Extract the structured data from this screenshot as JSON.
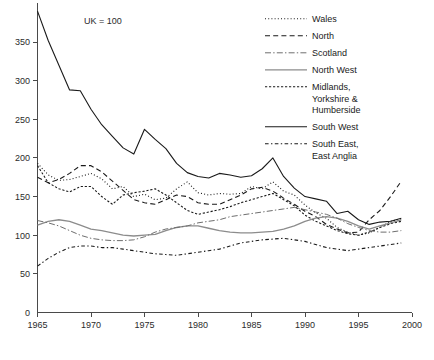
{
  "title_partial": "",
  "annotation": {
    "uk_base": "UK = 100"
  },
  "axes": {
    "y_ticks": [
      "50",
      "100",
      "150",
      "200",
      "250",
      "300",
      "350"
    ],
    "y_zero": "0",
    "x_ticks": [
      "1965",
      "1970",
      "1975",
      "1980",
      "1985",
      "1990",
      "1995",
      "2000"
    ]
  },
  "legend": {
    "items": [
      {
        "label": "Wales",
        "style": "dotted",
        "color": "#1a1a1a"
      },
      {
        "label": "North",
        "style": "dashed",
        "color": "#1a1a1a"
      },
      {
        "label": "Scotland",
        "style": "dash-dot",
        "color": "#6e6e6e"
      },
      {
        "label": "North West",
        "style": "solid",
        "color": "#8c8c8c"
      },
      {
        "label": "Midlands, Yorkshire & Humberside",
        "style": "dotted-dense",
        "color": "#1a1a1a"
      },
      {
        "label": "South West",
        "style": "long-dash-dot",
        "color": "#1a1a1a"
      },
      {
        "label": "South East, East Anglia",
        "style": "dash-dash",
        "color": "#1a1a1a"
      }
    ],
    "wrapped_labels": {
      "midlands": [
        "Midlands,",
        "Yorkshire &",
        "Humberside"
      ],
      "southeast": [
        "South East,",
        "East Anglia"
      ]
    }
  },
  "chart_data": {
    "type": "line",
    "title": "",
    "subtitle": "",
    "xlabel": "",
    "ylabel": "",
    "xlim": [
      1965,
      2000
    ],
    "ylim": [
      0,
      390
    ],
    "grid": false,
    "legend_position": "top-right",
    "annotations": [
      "UK = 100"
    ],
    "x": [
      1965,
      1966,
      1967,
      1968,
      1969,
      1970,
      1971,
      1972,
      1973,
      1974,
      1975,
      1976,
      1977,
      1978,
      1979,
      1980,
      1981,
      1982,
      1983,
      1984,
      1985,
      1986,
      1987,
      1988,
      1989,
      1990,
      1991,
      1992,
      1993,
      1994,
      1995,
      1996,
      1997,
      1998,
      1999
    ],
    "series": [
      {
        "name": "South West",
        "style": "long-dash-dot",
        "values": [
          390,
          352,
          320,
          288,
          287,
          263,
          243,
          228,
          213,
          205,
          237,
          224,
          212,
          193,
          181,
          176,
          174,
          180,
          178,
          175,
          177,
          186,
          200,
          176,
          161,
          150,
          147,
          144,
          128,
          131,
          120,
          114,
          117,
          118,
          122
        ]
      },
      {
        "name": "Wales",
        "style": "dotted",
        "values": [
          193,
          178,
          171,
          172,
          176,
          180,
          173,
          160,
          163,
          150,
          153,
          146,
          148,
          160,
          169,
          155,
          152,
          154,
          153,
          154,
          163,
          160,
          169,
          157,
          152,
          139,
          129,
          122,
          110,
          104,
          100,
          103,
          110,
          118,
          121
        ]
      },
      {
        "name": "North",
        "style": "dashed",
        "values": [
          175,
          168,
          172,
          180,
          190,
          190,
          182,
          170,
          158,
          146,
          142,
          140,
          146,
          152,
          150,
          142,
          140,
          140,
          146,
          152,
          160,
          162,
          157,
          148,
          140,
          131,
          124,
          114,
          108,
          103,
          104,
          120,
          132,
          150,
          170
        ]
      },
      {
        "name": "Midlands, Yorkshire & Humberside",
        "style": "dotted-dense",
        "values": [
          190,
          168,
          160,
          156,
          163,
          163,
          150,
          140,
          152,
          155,
          157,
          160,
          152,
          142,
          132,
          127,
          130,
          133,
          137,
          142,
          146,
          150,
          154,
          146,
          138,
          126,
          118,
          112,
          106,
          102,
          100,
          104,
          110,
          115,
          118
        ]
      },
      {
        "name": "North West",
        "style": "solid",
        "values": [
          113,
          118,
          120,
          118,
          113,
          108,
          106,
          103,
          100,
          99,
          100,
          101,
          106,
          110,
          112,
          112,
          109,
          106,
          104,
          103,
          103,
          104,
          105,
          108,
          112,
          118,
          122,
          124,
          122,
          118,
          112,
          108,
          112,
          116,
          120
        ]
      },
      {
        "name": "Scotland",
        "style": "dash-dot",
        "values": [
          119,
          116,
          112,
          106,
          100,
          96,
          94,
          93,
          93,
          94,
          98,
          104,
          108,
          110,
          112,
          116,
          118,
          120,
          124,
          126,
          128,
          130,
          132,
          134,
          136,
          133,
          130,
          127,
          122,
          115,
          110,
          106,
          104,
          104,
          106
        ]
      },
      {
        "name": "South East, East Anglia",
        "style": "dash-dash",
        "values": [
          60,
          70,
          78,
          84,
          86,
          86,
          84,
          84,
          82,
          80,
          78,
          76,
          75,
          74,
          76,
          78,
          80,
          82,
          86,
          90,
          92,
          94,
          95,
          96,
          94,
          92,
          88,
          84,
          82,
          80,
          82,
          84,
          86,
          88,
          90
        ]
      }
    ]
  },
  "colors": {
    "axis": "#4a4a4a",
    "text": "#1a1a1a",
    "dark_line": "#1a1a1a",
    "gray_line": "#8c8c8c",
    "mid_gray_line": "#6e6e6e",
    "background": "#ffffff"
  }
}
